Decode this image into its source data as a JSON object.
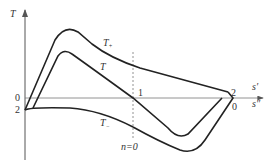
{
  "diagram": {
    "y_axis_label": "T",
    "x_axis_labels": {
      "upper": "s′",
      "lower": "s″"
    },
    "left_labels": {
      "upper": "0",
      "lower": "2"
    },
    "right_labels": {
      "upper": "2",
      "lower": "0"
    },
    "center_point_label": "1",
    "dashed_line_label": "n=0",
    "curves": {
      "t_plus": {
        "label": "T",
        "subscript": "+"
      },
      "t": {
        "label": "T"
      },
      "t_minus": {
        "label": "T",
        "subscript": "−"
      }
    },
    "colors": {
      "stroke": "#222222",
      "axis": "#555555",
      "dashed": "#777777"
    }
  }
}
